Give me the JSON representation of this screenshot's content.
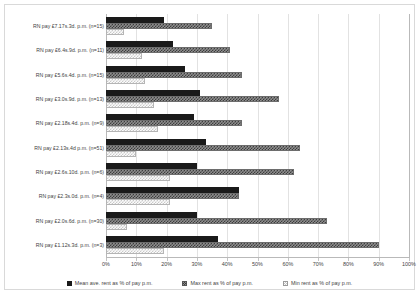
{
  "chart_data": {
    "type": "bar",
    "orientation": "horizontal",
    "title": "",
    "xlabel": "",
    "ylabel": "",
    "xlim": [
      0,
      100
    ],
    "xtick_labels": [
      "0%",
      "10%",
      "20%",
      "30%",
      "40%",
      "50%",
      "60%",
      "70%",
      "80%",
      "90%",
      "100%"
    ],
    "xtick_values": [
      0,
      10,
      20,
      30,
      40,
      50,
      60,
      70,
      80,
      90,
      100
    ],
    "grid": true,
    "legend_position": "bottom",
    "categories": [
      "RN pay £7.17s.3d. p.m. (n=15)",
      "RN pay £6.4s.9d. p.m. (n=11)",
      "RN pay £5.6s.4d. p.m. (n=15)",
      "RN pay £3.0s.9d. p.m. (n=13)",
      "RN pay £2.18s.4d. p.m. (n=9)",
      "RN pay £2.13s.4d p.m. (n=51)",
      "RN pay £2.6s.10d. p.m. (n=6)",
      "RN pay £2.3s.0d. p.m. (n=4)",
      "RN pay £2.0s.6d. p.m. (n=30)",
      "RN pay £1.12s.3d. p.m. (n=3)"
    ],
    "series": [
      {
        "name": "Mean ave. rent as % of pay p.m.",
        "key": "mean",
        "color": "#1a1a1a",
        "values": [
          19,
          22,
          26,
          31,
          29,
          33,
          30,
          44,
          30,
          37
        ]
      },
      {
        "name": "Max rent as % of pay p.m.",
        "key": "max",
        "color": "#8e8e8e",
        "values": [
          35,
          41,
          45,
          57,
          45,
          64,
          62,
          44,
          73,
          90
        ]
      },
      {
        "name": "Min rent as % of pay p.m.",
        "key": "min",
        "color": "#fbfbfb",
        "values": [
          6,
          12,
          13,
          16,
          17,
          10,
          21,
          21,
          7,
          19
        ]
      }
    ]
  }
}
